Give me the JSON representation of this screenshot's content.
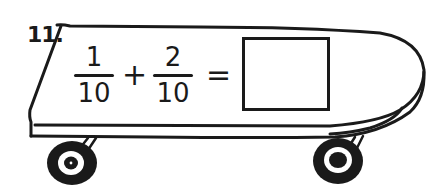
{
  "problem": {
    "label": "11.",
    "fraction_a": {
      "numerator": "1",
      "denominator": "10"
    },
    "operator": "+",
    "fraction_b": {
      "numerator": "2",
      "denominator": "10"
    },
    "equals": "=",
    "answer": ""
  },
  "illustration": {
    "subject": "skateboard",
    "stroke_color": "#1a1a1a",
    "background_color": "#ffffff"
  }
}
